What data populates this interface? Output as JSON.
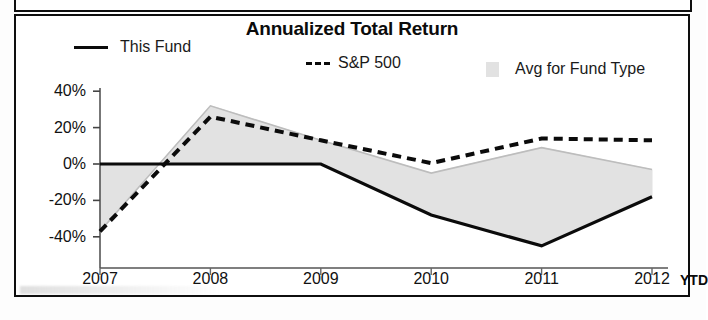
{
  "panel": {
    "title": "Annualized Total Return"
  },
  "legend": [
    {
      "key": "this_fund",
      "label": "This Fund",
      "marker": "solid-line-swatch",
      "color": "#0b0b0b"
    },
    {
      "key": "sp500",
      "label": "S&P 500",
      "marker": "dashed-line-swatch",
      "color": "#0b0b0b"
    },
    {
      "key": "avg_fund_type",
      "label": "Avg for Fund Type",
      "marker": "filled-band-swatch",
      "color": "#e2e2e2"
    }
  ],
  "axis": {
    "y_ticks": [
      "40%",
      "20%",
      "0%",
      "-20%",
      "-40%"
    ],
    "x_ticks": [
      "2007",
      "2008",
      "2009",
      "2010",
      "2011",
      "2012"
    ],
    "x_suffix": "YTD"
  },
  "chart_data": {
    "type": "line",
    "title": "Annualized Total Return",
    "xlabel": "",
    "ylabel": "",
    "ylim": [
      -50,
      40
    ],
    "yticks": [
      40,
      20,
      0,
      -20,
      -40
    ],
    "ytick_labels": [
      "40%",
      "20%",
      "0%",
      "-20%",
      "-40%"
    ],
    "grid": false,
    "legend_position": "top",
    "categories": [
      "2007",
      "2008",
      "2009",
      "2010",
      "2011",
      "2012"
    ],
    "x_axis_note": "YTD",
    "series": [
      {
        "name": "This Fund",
        "style": "solid",
        "color": "#0b0b0b",
        "values": [
          0,
          0,
          0,
          -28,
          -45,
          -18
        ]
      },
      {
        "name": "S&P 500",
        "style": "dashed",
        "color": "#0b0b0b",
        "values": [
          -37,
          26,
          13,
          0.5,
          14,
          13
        ]
      },
      {
        "name": "Avg for Fund Type",
        "style": "filled-band",
        "color": "#e2e2e2",
        "values": [
          -37,
          32,
          13,
          -5,
          9,
          -3
        ]
      }
    ],
    "band": {
      "name": "Avg for Fund Type",
      "fill": "#e2e2e2",
      "upper": [
        -37,
        32,
        13,
        -5,
        9,
        -3
      ],
      "baseline_series": "This Fund"
    }
  }
}
